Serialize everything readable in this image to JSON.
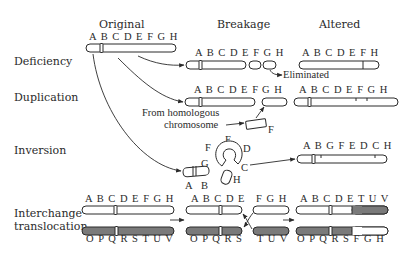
{
  "columns": {
    "original": "Original",
    "breakage": "Breakage",
    "altered": "Altered"
  },
  "rows": {
    "deficiency": {
      "label": "Deficiency",
      "original": "A B C D E F G H",
      "breakage": "A B C D E F  G  H",
      "altered": "A B C D E F H",
      "note": "Eliminated"
    },
    "duplication": {
      "label": "Duplication",
      "breakage_left": "A B C D E F",
      "breakage_right": "G H",
      "fragment": "F",
      "source_note_line1": "From homologous",
      "source_note_line2": "chromosome",
      "altered": "A B C D E F G H"
    },
    "inversion": {
      "label": "Inversion",
      "loop_letters": [
        "F",
        "E",
        "D",
        "G",
        "C",
        "A",
        "B",
        "H"
      ],
      "altered": "A B G F E D C H"
    },
    "translocation": {
      "label_line1": "Interchange",
      "label_line2": "translocation",
      "original_top": "A B C D E F G H",
      "original_bottom": "O P Q R S T U V",
      "breakage_top_left": "A B C D E",
      "breakage_top_right": "F G H",
      "breakage_bottom_left": "O P Q R S",
      "breakage_bottom_right": "T U V",
      "altered_top": "A B C D E T U V",
      "altered_bottom": "O P Q R S F G H"
    }
  },
  "colors": {
    "line": "#2a2a2a",
    "chromosome_fill": "#ffffff",
    "shaded_chromosome": "#7a7a7a"
  }
}
